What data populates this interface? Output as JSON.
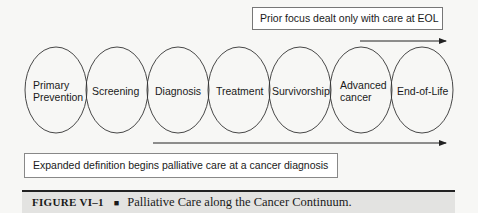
{
  "top_note": {
    "text": "Prior focus dealt only with care at EOL"
  },
  "bottom_note": {
    "text": "Expanded definition begins palliative care at a cancer diagnosis"
  },
  "stages": [
    {
      "line1": "Primary",
      "line2": "Prevention"
    },
    {
      "line1": "Screening",
      "line2": ""
    },
    {
      "line1": "Diagnosis",
      "line2": ""
    },
    {
      "line1": "Treatment",
      "line2": ""
    },
    {
      "line1": "Survivorship",
      "line2": ""
    },
    {
      "line1": "Advanced",
      "line2": "cancer"
    },
    {
      "line1": "End-of-Life",
      "line2": ""
    }
  ],
  "caption": {
    "label": "FIGURE VI–1",
    "separator": "■",
    "title": "Palliative Care along the Cancer Continuum."
  }
}
